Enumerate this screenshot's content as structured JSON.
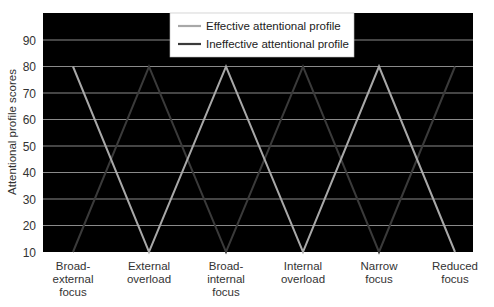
{
  "chart_data": {
    "type": "line",
    "title": "",
    "xlabel": "",
    "ylabel": "Attentional profile scores",
    "ylim": [
      10,
      98
    ],
    "yticks": [
      10,
      20,
      30,
      40,
      50,
      60,
      70,
      80,
      90
    ],
    "grid": true,
    "background": "#000000",
    "legend_position": "top-center (inside plot)",
    "categories": [
      [
        "Broad-",
        "external",
        "focus"
      ],
      [
        "External",
        "overload"
      ],
      [
        "Broad-",
        "internal",
        "focus"
      ],
      [
        "Internal",
        "overload"
      ],
      [
        "Narrow",
        "focus"
      ],
      [
        "Reduced",
        "focus"
      ]
    ],
    "series": [
      {
        "name": "Effective attentional profile",
        "color": "#a8a8a8",
        "values": [
          80,
          10,
          80,
          10,
          80,
          10
        ]
      },
      {
        "name": "Ineffective attentional profile",
        "color": "#3a3a3a",
        "values": [
          10,
          80,
          10,
          80,
          10,
          80
        ]
      }
    ]
  }
}
